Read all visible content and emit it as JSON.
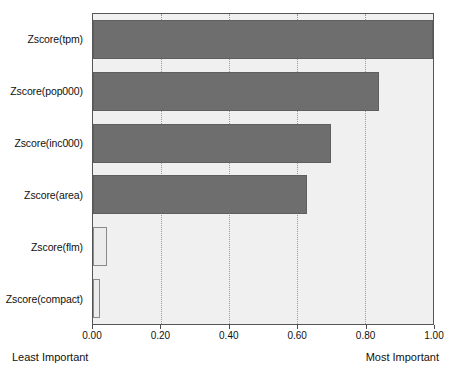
{
  "chart_data": {
    "type": "bar",
    "orientation": "horizontal",
    "title": "",
    "xlabel": "",
    "ylabel": "",
    "xlim": [
      0.0,
      1.0
    ],
    "grid": true,
    "legend": null,
    "categories": [
      "Zscore(tpm)",
      "Zscore(pop000)",
      "Zscore(inc000)",
      "Zscore(area)",
      "Zscore(flm)",
      "Zscore(compact)"
    ],
    "values": [
      1.0,
      0.84,
      0.7,
      0.63,
      0.04,
      0.02
    ],
    "bar_styles": [
      "dark",
      "dark",
      "dark",
      "dark",
      "light",
      "light"
    ],
    "xticks": [
      0.0,
      0.2,
      0.4,
      0.6,
      0.8,
      1.0
    ],
    "xticklabels": [
      "0.00",
      "0.20",
      "0.40",
      "0.60",
      "0.80",
      "1.00"
    ],
    "annotations": {
      "left": "Least Important",
      "right": "Most Important"
    },
    "colors": {
      "bar_dark_fill": "#6e6e6e",
      "bar_dark_edge": "#5f5f5f",
      "bar_light_fill": "#ececec",
      "bar_light_edge": "#8a8a8a",
      "panel_background": "#f0f0f0",
      "panel_border": "#555555",
      "gridline": "#9a9a9a",
      "text": "#111111"
    }
  }
}
